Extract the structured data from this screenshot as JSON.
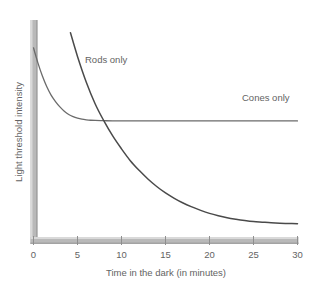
{
  "chart_data": {
    "type": "line",
    "title": "",
    "xlabel": "Time in the dark (in minutes)",
    "ylabel": "Light threshold intensity",
    "xlim": [
      0,
      30
    ],
    "ylim": [
      0,
      100
    ],
    "grid": false,
    "legend_position": "inline-annotation",
    "xticks": [
      0,
      5,
      10,
      15,
      20,
      25,
      30
    ],
    "xtick_labels": [
      "0",
      "5",
      "10",
      "15",
      "20",
      "25",
      "30"
    ],
    "yticks": [],
    "ytick_labels": [],
    "annotations": [
      {
        "text": "Rods only",
        "x": 7.5,
        "y": 84
      },
      {
        "text": "Cones only",
        "x": 23.5,
        "y": 66
      }
    ],
    "series": [
      {
        "name": "Cones only",
        "label": "Cones only",
        "color": "#6b6b6b",
        "x": [
          0.0,
          0.5,
          1.0,
          1.5,
          2.0,
          2.5,
          3.0,
          3.5,
          4.0,
          4.5,
          5.0,
          5.5,
          6.0,
          6.5,
          7.0,
          8.0,
          9.0,
          10.0,
          12.0,
          14.0,
          16.0,
          18.0,
          20.0,
          22.0,
          24.0,
          26.0,
          28.0,
          30.0
        ],
        "y": [
          88.0,
          81.0,
          75.0,
          70.0,
          66.0,
          63.0,
          60.5,
          58.5,
          57.0,
          56.0,
          55.3,
          54.8,
          54.5,
          54.3,
          54.2,
          54.1,
          54.0,
          54.0,
          54.0,
          54.0,
          54.0,
          54.0,
          54.0,
          54.0,
          54.0,
          54.0,
          54.0,
          54.0
        ]
      },
      {
        "name": "Rods only",
        "label": "Rods only",
        "color": "#4a4a4a",
        "x": [
          4.2,
          5.0,
          6.0,
          7.0,
          8.0,
          9.0,
          10.0,
          11.0,
          12.0,
          13.0,
          14.0,
          15.0,
          16.0,
          17.0,
          18.0,
          19.0,
          20.0,
          21.0,
          22.0,
          23.0,
          24.0,
          25.0,
          26.0,
          27.0,
          28.0,
          29.0,
          30.0
        ],
        "y": [
          95.0,
          84.0,
          72.0,
          62.0,
          54.0,
          47.0,
          41.0,
          35.5,
          31.0,
          27.0,
          23.5,
          20.5,
          18.0,
          15.8,
          14.0,
          12.4,
          11.0,
          9.9,
          9.0,
          8.3,
          7.7,
          7.2,
          6.9,
          6.6,
          6.4,
          6.3,
          6.2
        ]
      }
    ],
    "axes_style": {
      "axis_color": "#b5b5b5",
      "axis_shadow_color": "#cfcfcf",
      "axis_thickness_px": 7,
      "tick_color": "#9a9a9a"
    }
  },
  "axis": {
    "x_label": "Time in the dark (in minutes)",
    "y_label": "Light threshold intensity"
  },
  "ticks": {
    "x": [
      "0",
      "5",
      "10",
      "15",
      "20",
      "25",
      "30"
    ]
  },
  "labels": {
    "rods": "Rods only",
    "cones": "Cones only"
  },
  "colors": {
    "background": "#ffffff",
    "axis": "#b5b5b5",
    "axis_highlight": "#d8d8d8",
    "text": "#636363",
    "rods_curve": "#4a4a4a",
    "cones_curve": "#6b6b6b"
  }
}
